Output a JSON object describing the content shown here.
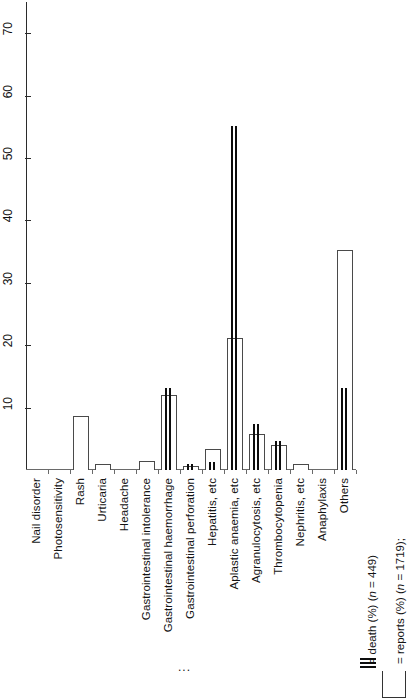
{
  "chart_data": {
    "type": "bar",
    "title": "",
    "subtitle": "",
    "xlabel": "",
    "ylabel": "",
    "orientation": "vertical-rotated-90",
    "grid": false,
    "ylim": [
      0,
      75
    ],
    "yticks": [
      10,
      20,
      30,
      40,
      50,
      60,
      70
    ],
    "ytick_labels": [
      "10",
      "20",
      "30",
      "40",
      "50",
      "60",
      "70"
    ],
    "categories": [
      "Nail disorder",
      "Photosensitivity",
      "Rash",
      "Urticaria",
      "Headache",
      "Gastrointestinal intolerance",
      "Gastrointestinal haemorrhage",
      "Gastrointestinal perforation",
      "Hepatitis, etc",
      "Aplastic anaemia, etc",
      "Agranulocytosis, etc",
      "Thrombocytopenia",
      "Nephritis, etc",
      "Anaphylaxis",
      "Others"
    ],
    "series": [
      {
        "name": "reports (%)",
        "n": 1719,
        "style": "open-bar",
        "values": [
          0,
          0,
          8.7,
          1.0,
          0,
          1.4,
          12.0,
          0.6,
          3.3,
          21.2,
          5.8,
          4.0,
          0.9,
          0,
          35.2
        ]
      },
      {
        "name": "death (%)",
        "n": 449,
        "style": "double-line",
        "values": [
          0,
          0,
          0,
          0,
          0,
          0,
          13.2,
          1.0,
          1.3,
          55.1,
          7.3,
          4.7,
          0,
          0,
          13.2
        ]
      }
    ],
    "legend": {
      "position": "right",
      "entries": [
        {
          "marker": "open-box",
          "label": "= reports (%) (n = 1719);"
        },
        {
          "marker": "double-line",
          "label": "= death (%) (n = 449)"
        }
      ],
      "reports_text_plain": "= reports (%) (",
      "reports_italic_n": "n",
      "reports_text_tail": " = 1719);",
      "death_text_plain": "= death (%) (",
      "death_italic_n": "n",
      "death_text_tail": " = 449)"
    },
    "annotations": [
      "..."
    ]
  },
  "axis": {
    "tick_10": "10",
    "tick_20": "20",
    "tick_30": "30",
    "tick_40": "40",
    "tick_50": "50",
    "tick_60": "60",
    "tick_70": "70"
  },
  "labels": {
    "c0": "Nail disorder",
    "c1": "Photosensitivity",
    "c2": "Rash",
    "c3": "Urticaria",
    "c4": "Headache",
    "c5": "Gastrointestinal intolerance",
    "c6": "Gastrointestinal haemorrhage",
    "c7": "Gastrointestinal perforation",
    "c8": "Hepatitis, etc",
    "c9": "Aplastic anaemia, etc",
    "c10": "Agranulocytosis, etc",
    "c11": "Thrombocytopenia",
    "c12": "Nephritis, etc",
    "c13": "Anaphylaxis",
    "c14": "Others"
  },
  "legend": {
    "reports_full": "= reports (%) (n = 1719);",
    "death_full": "= death (%) (n = 449)"
  },
  "misc": {
    "ellipsis": "..."
  }
}
